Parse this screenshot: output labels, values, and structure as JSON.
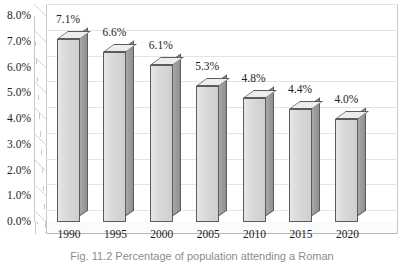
{
  "chart_data": {
    "type": "bar",
    "title": "",
    "xlabel": "",
    "ylabel": "",
    "categories": [
      "1990",
      "1995",
      "2000",
      "2005",
      "2010",
      "2015",
      "2020"
    ],
    "values": [
      7.1,
      6.6,
      6.1,
      5.3,
      4.8,
      4.4,
      4.0
    ],
    "value_labels": [
      "7.1%",
      "6.6%",
      "6.1%",
      "5.3%",
      "4.8%",
      "4.4%",
      "4.0%"
    ],
    "ylim": [
      0,
      8
    ],
    "ytick_values": [
      8.0,
      7.0,
      6.0,
      5.0,
      4.0,
      3.0,
      2.0,
      1.0,
      0.0
    ],
    "ytick_labels": [
      "8.0%",
      "7.0%",
      "6.0%",
      "5.0%",
      "4.0%",
      "3.0%",
      "2.0%",
      "1.0%",
      "0.0%"
    ],
    "grid": true,
    "legend": null,
    "style": "3d-column",
    "bar_face_color": "#d9d9d9",
    "bar_side_color": "#9d9d9d",
    "bar_top_color": "#ededed",
    "bar_edge_color": "#5c5c5c",
    "gridline_color": "#e4e4e4",
    "text_color": "#1d1d1d"
  },
  "caption": {
    "text": "Fig. 11.2 Percentage of population attending a Roman"
  }
}
